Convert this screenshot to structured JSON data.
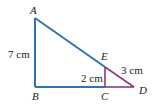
{
  "diagram": {
    "type": "geometry-similar-triangles",
    "points": {
      "A": {
        "label": "A"
      },
      "B": {
        "label": "B"
      },
      "C": {
        "label": "C"
      },
      "D": {
        "label": "D"
      },
      "E": {
        "label": "E"
      }
    },
    "measurements": {
      "AB": "7 cm",
      "EC": "2 cm",
      "ED": "3 cm"
    },
    "colors": {
      "large_triangle": "#2e74b5",
      "small_triangle": "#8e3a7e"
    }
  }
}
